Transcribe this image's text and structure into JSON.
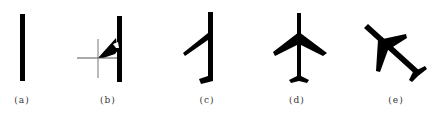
{
  "figure": {
    "panels": [
      {
        "id": "a",
        "label": "(a)",
        "description": "vertical bar (fuselage only)"
      },
      {
        "id": "b",
        "label": "(b)",
        "description": "fuselage with one wing partially drawn and crosshair cursor"
      },
      {
        "id": "c",
        "label": "(c)",
        "description": "fuselage with one wing and half tail"
      },
      {
        "id": "d",
        "label": "(d)",
        "description": "complete airplane silhouette, upright"
      },
      {
        "id": "e",
        "label": "(e)",
        "description": "complete airplane silhouette, rotated"
      }
    ],
    "colors": {
      "shape": "#000000",
      "background": "#ffffff",
      "crosshair": "#555555"
    }
  }
}
